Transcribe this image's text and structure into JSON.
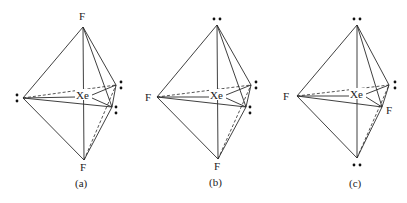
{
  "figure": {
    "center_atom": "Xe",
    "structures": [
      {
        "caption": "(a)",
        "center_label": "Xe",
        "top": {
          "type": "atom",
          "label": "F"
        },
        "bottom": {
          "type": "atom",
          "label": "F"
        },
        "left": {
          "type": "lone-pair"
        },
        "right_back": {
          "type": "lone-pair"
        },
        "right_front": {
          "type": "lone-pair"
        }
      },
      {
        "caption": "(b)",
        "center_label": "Xe",
        "top": {
          "type": "lone-pair"
        },
        "bottom": {
          "type": "atom",
          "label": "F"
        },
        "left": {
          "type": "atom",
          "label": "F"
        },
        "right_back": {
          "type": "lone-pair"
        },
        "right_front": {
          "type": "lone-pair"
        }
      },
      {
        "caption": "(c)",
        "center_label": "Xe",
        "top": {
          "type": "lone-pair"
        },
        "bottom": {
          "type": "lone-pair"
        },
        "left": {
          "type": "atom",
          "label": "F"
        },
        "right_back": {
          "type": "lone-pair"
        },
        "right_front": {
          "type": "atom",
          "label": "F"
        }
      }
    ]
  }
}
